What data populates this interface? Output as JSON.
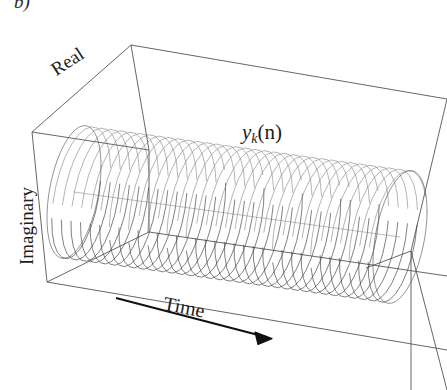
{
  "figure": {
    "panel_letter": "b)",
    "background_color": "#ffffff",
    "line_color": "#444444",
    "box_line_color": "#555555",
    "helix_color": "#3a3a3a",
    "arrow_color": "#111111",
    "text_color": "#1c1c1c"
  },
  "labels": {
    "real_axis": "Real",
    "imaginary_axis": "Imaginary",
    "time_axis": "Time",
    "signal_variable": "y",
    "signal_subscript": "k",
    "signal_argument": "(n)"
  },
  "chart_data": {
    "type": "line",
    "title": "",
    "subtitle": "",
    "xlabel": "Time",
    "ylabel": "Imaginary",
    "zlabel": "Real",
    "annotations": [
      "y_k(n)",
      "b)"
    ],
    "legend": [],
    "grid": false,
    "projection": "3d-box",
    "series": [
      {
        "name": "y_k(n)",
        "form": "helix",
        "real_component": "cos(2*pi*k*n/N)",
        "imag_component": "sin(2*pi*k*n/N)",
        "cycles": 34,
        "radius": 1.0,
        "n_start": 0,
        "n_end": 1
      }
    ],
    "axis_ranges": {
      "time": [
        0,
        1
      ],
      "real": [
        -1,
        1
      ],
      "imaginary": [
        -1,
        1
      ]
    },
    "arrow": {
      "label": "Time",
      "direction": "increasing",
      "points_to": "right"
    }
  }
}
